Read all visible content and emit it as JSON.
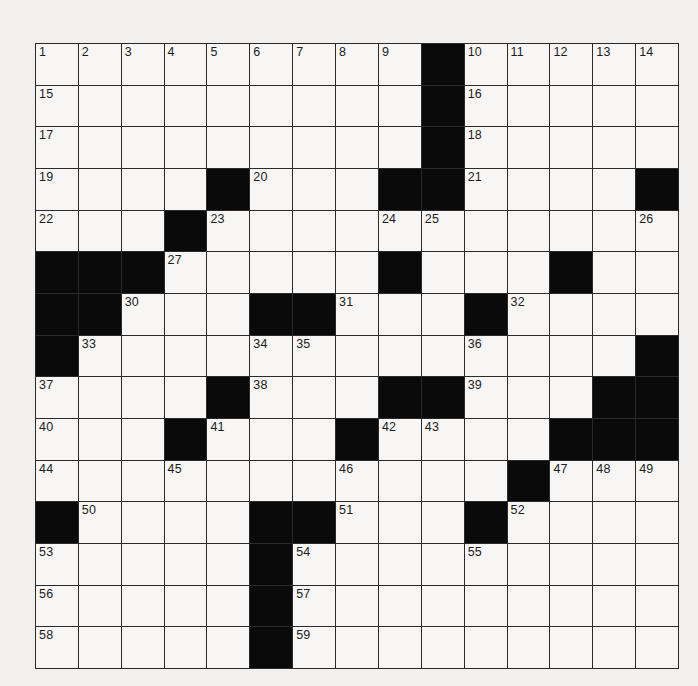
{
  "puzzle": {
    "rows": 15,
    "cols": 15,
    "grid": [
      ".........#.....",
      ".........#.....",
      ".........#.....",
      "....#...##....#",
      "...#...........",
      "###.....#...#..",
      "##...##...#....",
      "#.............#",
      "....#...##...##",
      "...#...#....###",
      "...........#...",
      "#....##...#....",
      ".....#.........",
      ".....#.........",
      ".....#........."
    ],
    "numbers": [
      {
        "r": 0,
        "c": 0,
        "n": 1
      },
      {
        "r": 0,
        "c": 1,
        "n": 2
      },
      {
        "r": 0,
        "c": 2,
        "n": 3
      },
      {
        "r": 0,
        "c": 3,
        "n": 4
      },
      {
        "r": 0,
        "c": 4,
        "n": 5
      },
      {
        "r": 0,
        "c": 5,
        "n": 6
      },
      {
        "r": 0,
        "c": 6,
        "n": 7
      },
      {
        "r": 0,
        "c": 7,
        "n": 8
      },
      {
        "r": 0,
        "c": 8,
        "n": 9
      },
      {
        "r": 0,
        "c": 10,
        "n": 10
      },
      {
        "r": 0,
        "c": 11,
        "n": 11
      },
      {
        "r": 0,
        "c": 12,
        "n": 12
      },
      {
        "r": 0,
        "c": 13,
        "n": 13
      },
      {
        "r": 0,
        "c": 14,
        "n": 14
      },
      {
        "r": 1,
        "c": 0,
        "n": 15
      },
      {
        "r": 1,
        "c": 10,
        "n": 16
      },
      {
        "r": 2,
        "c": 0,
        "n": 17
      },
      {
        "r": 2,
        "c": 10,
        "n": 18
      },
      {
        "r": 3,
        "c": 0,
        "n": 19
      },
      {
        "r": 3,
        "c": 5,
        "n": 20
      },
      {
        "r": 3,
        "c": 10,
        "n": 21
      },
      {
        "r": 4,
        "c": 0,
        "n": 22
      },
      {
        "r": 4,
        "c": 4,
        "n": 23
      },
      {
        "r": 4,
        "c": 8,
        "n": 24
      },
      {
        "r": 4,
        "c": 9,
        "n": 25
      },
      {
        "r": 4,
        "c": 14,
        "n": 26
      },
      {
        "r": 5,
        "c": 3,
        "n": 27
      },
      {
        "r": 5,
        "c": 8,
        "n": 28
      },
      {
        "r": 5,
        "c": 12,
        "n": 29
      },
      {
        "r": 6,
        "c": 2,
        "n": 30
      },
      {
        "r": 6,
        "c": 7,
        "n": 31
      },
      {
        "r": 6,
        "c": 11,
        "n": 32
      },
      {
        "r": 7,
        "c": 1,
        "n": 33
      },
      {
        "r": 7,
        "c": 5,
        "n": 34
      },
      {
        "r": 7,
        "c": 6,
        "n": 35
      },
      {
        "r": 7,
        "c": 10,
        "n": 36
      },
      {
        "r": 8,
        "c": 0,
        "n": 37
      },
      {
        "r": 8,
        "c": 5,
        "n": 38
      },
      {
        "r": 8,
        "c": 10,
        "n": 39
      },
      {
        "r": 9,
        "c": 0,
        "n": 40
      },
      {
        "r": 9,
        "c": 4,
        "n": 41
      },
      {
        "r": 9,
        "c": 8,
        "n": 42
      },
      {
        "r": 9,
        "c": 9,
        "n": 43
      },
      {
        "r": 10,
        "c": 0,
        "n": 44
      },
      {
        "r": 10,
        "c": 3,
        "n": 45
      },
      {
        "r": 10,
        "c": 7,
        "n": 46
      },
      {
        "r": 10,
        "c": 12,
        "n": 47
      },
      {
        "r": 10,
        "c": 13,
        "n": 48
      },
      {
        "r": 10,
        "c": 14,
        "n": 49
      },
      {
        "r": 11,
        "c": 1,
        "n": 50
      },
      {
        "r": 11,
        "c": 7,
        "n": 51
      },
      {
        "r": 11,
        "c": 11,
        "n": 52
      },
      {
        "r": 12,
        "c": 0,
        "n": 53
      },
      {
        "r": 12,
        "c": 6,
        "n": 54
      },
      {
        "r": 12,
        "c": 10,
        "n": 55
      },
      {
        "r": 13,
        "c": 0,
        "n": 56
      },
      {
        "r": 13,
        "c": 6,
        "n": 57
      },
      {
        "r": 14,
        "c": 0,
        "n": 58
      },
      {
        "r": 14,
        "c": 6,
        "n": 59
      }
    ],
    "entries": {}
  },
  "colors": {
    "background": "#f1f0ee",
    "cell": "#f7f6f4",
    "block": "#0a0a0a",
    "gridline": "#2a2a2a"
  }
}
